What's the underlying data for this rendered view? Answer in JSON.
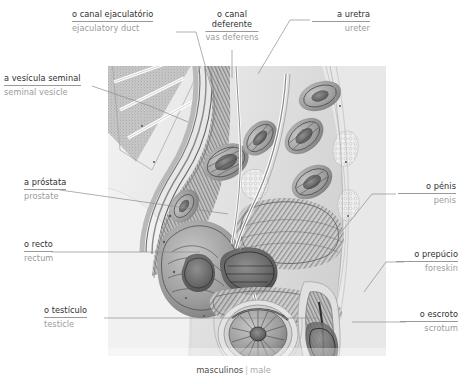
{
  "caption": {
    "pt": "masculinos",
    "separator": "|",
    "en": "male"
  },
  "labels": [
    {
      "id": "ejaculatory-duct",
      "term": "o canal ejaculatório",
      "gloss": "ejaculatory duct",
      "align": "left"
    },
    {
      "id": "vas-deferens",
      "term_line1": "o canal",
      "term_line2": "deferente",
      "term": "o canal deferente",
      "gloss": "vas deferens",
      "align": "center"
    },
    {
      "id": "ureter",
      "term": "a uretra",
      "gloss": "ureter",
      "align": "right"
    },
    {
      "id": "seminal-vesicle",
      "term": "a vesícula seminal",
      "gloss": "seminal vesicle",
      "align": "left"
    },
    {
      "id": "prostate",
      "term": "a próstata",
      "gloss": "prostate",
      "align": "left"
    },
    {
      "id": "rectum",
      "term": "o recto",
      "gloss": "rectum",
      "align": "left"
    },
    {
      "id": "testicle",
      "term": "o testículo",
      "gloss": "testicle",
      "align": "left"
    },
    {
      "id": "penis",
      "term": "o pénis",
      "gloss": "penis",
      "align": "right"
    },
    {
      "id": "foreskin",
      "term": "o prepúcio",
      "gloss": "foreskin",
      "align": "right"
    },
    {
      "id": "scrotum",
      "term": "o escroto",
      "gloss": "scrotum",
      "align": "right"
    }
  ],
  "colors": {
    "background": "#ffffff",
    "term_text": "#2f2f2f",
    "gloss_text": "#9b9b9b",
    "leader_line": "#8d8d8d",
    "illustration_base": "#d9d9d9"
  }
}
